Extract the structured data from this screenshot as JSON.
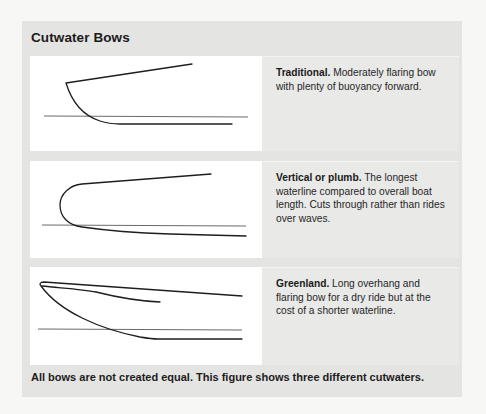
{
  "figure": {
    "title": "Cutwater Bows",
    "caption": "All bows are not created equal. This figure shows three different cutwaters.",
    "colors": {
      "box_background": "#e4e4e3",
      "text_cell_background": "#e9e9e8",
      "drawing_background": "#ffffff",
      "line_color": "#1e1e1e"
    },
    "bows": [
      {
        "name": "Traditional.",
        "description": " Moderately flaring bow with plenty of buoyancy forward.",
        "drawing_icon": "traditional-bow-profile-icon"
      },
      {
        "name": "Vertical or plumb.",
        "description": " The longest waterline compared to overall boat length. Cuts through rather than rides over waves.",
        "drawing_icon": "plumb-bow-profile-icon"
      },
      {
        "name": "Greenland.",
        "description": " Long overhang and flaring bow for a dry ride but at the cost of a shorter waterline.",
        "drawing_icon": "greenland-bow-profile-icon"
      }
    ]
  }
}
